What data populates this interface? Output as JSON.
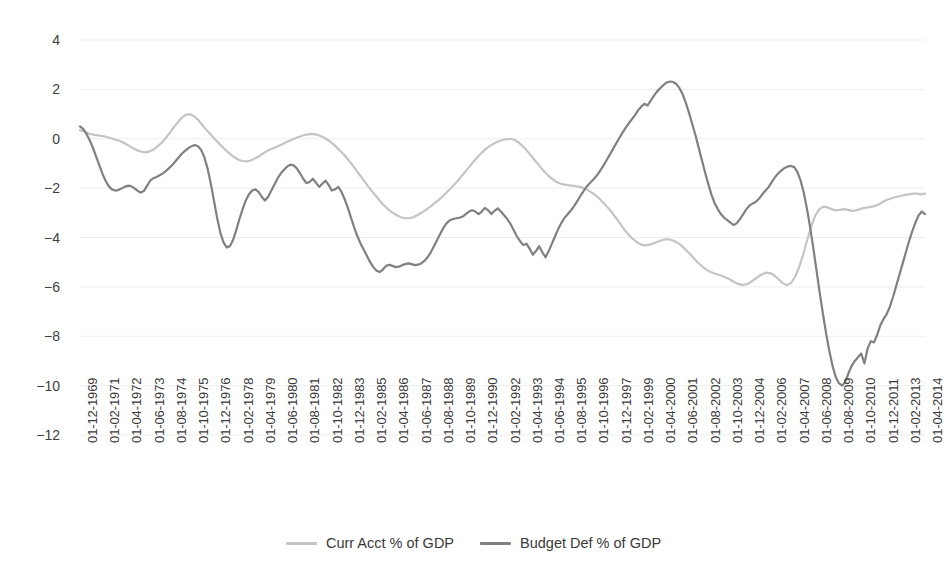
{
  "chart_data": {
    "type": "line",
    "title": "",
    "subtitle": "",
    "xlabel": "",
    "ylabel": "",
    "ylim": [
      -12,
      4
    ],
    "yticks": [
      4,
      2,
      0,
      -2,
      -4,
      -6,
      -8,
      -10,
      -12
    ],
    "ytick_labels": [
      "4",
      "2",
      "0",
      "−2",
      "−4",
      "−6",
      "−8",
      "−10",
      "−12"
    ],
    "grid": true,
    "grid_axis": "y",
    "legend_position": "bottom",
    "xtick_labels": [
      "01-12-1969",
      "01-02-1971",
      "01-04-1972",
      "01-06-1973",
      "01-08-1974",
      "01-10-1975",
      "01-12-1976",
      "01-02-1978",
      "01-04-1979",
      "01-06-1980",
      "01-08-1981",
      "01-10-1982",
      "01-12-1983",
      "01-02-1985",
      "01-04-1986",
      "01-06-1987",
      "01-08-1988",
      "01-10-1989",
      "01-12-1990",
      "01-02-1992",
      "01-04-1993",
      "01-06-1994",
      "01-08-1995",
      "01-10-1996",
      "01-12-1997",
      "01-02-1999",
      "01-04-2000",
      "01-06-2001",
      "01-08-2002",
      "01-10-2003",
      "01-12-2004",
      "01-02-2006",
      "01-04-2007",
      "01-06-2008",
      "01-08-2009",
      "01-10-2010",
      "01-12-2011",
      "01-02-2013",
      "01-04-2014"
    ],
    "x_start_year": 1969.917,
    "x_end_year": 2014.25,
    "series": [
      {
        "name": "Curr Acct % of GDP",
        "color": "#c4c4c4",
        "values": [
          0.35,
          0.3,
          0.22,
          0.18,
          0.15,
          0.12,
          0.1,
          0.05,
          0.0,
          -0.05,
          -0.1,
          -0.18,
          -0.28,
          -0.38,
          -0.46,
          -0.52,
          -0.55,
          -0.52,
          -0.45,
          -0.32,
          -0.18,
          0.0,
          0.22,
          0.45,
          0.65,
          0.85,
          0.97,
          1.0,
          0.92,
          0.78,
          0.58,
          0.38,
          0.2,
          0.02,
          -0.15,
          -0.32,
          -0.48,
          -0.62,
          -0.75,
          -0.85,
          -0.9,
          -0.92,
          -0.88,
          -0.8,
          -0.72,
          -0.6,
          -0.5,
          -0.42,
          -0.35,
          -0.28,
          -0.2,
          -0.12,
          -0.05,
          0.02,
          0.08,
          0.14,
          0.18,
          0.2,
          0.18,
          0.12,
          0.05,
          -0.05,
          -0.18,
          -0.32,
          -0.48,
          -0.65,
          -0.85,
          -1.05,
          -1.28,
          -1.5,
          -1.72,
          -1.95,
          -2.15,
          -2.35,
          -2.55,
          -2.72,
          -2.88,
          -3.0,
          -3.1,
          -3.18,
          -3.22,
          -3.22,
          -3.18,
          -3.1,
          -3.0,
          -2.9,
          -2.78,
          -2.65,
          -2.52,
          -2.38,
          -2.22,
          -2.05,
          -1.88,
          -1.7,
          -1.5,
          -1.3,
          -1.1,
          -0.9,
          -0.72,
          -0.55,
          -0.4,
          -0.28,
          -0.18,
          -0.1,
          -0.05,
          -0.02,
          0.0,
          -0.05,
          -0.15,
          -0.3,
          -0.48,
          -0.68,
          -0.88,
          -1.08,
          -1.28,
          -1.45,
          -1.6,
          -1.72,
          -1.8,
          -1.85,
          -1.88,
          -1.9,
          -1.92,
          -1.95,
          -2.0,
          -2.08,
          -2.18,
          -2.3,
          -2.45,
          -2.62,
          -2.8,
          -3.0,
          -3.22,
          -3.45,
          -3.68,
          -3.88,
          -4.05,
          -4.18,
          -4.28,
          -4.32,
          -4.3,
          -4.25,
          -4.18,
          -4.12,
          -4.08,
          -4.08,
          -4.12,
          -4.2,
          -4.32,
          -4.48,
          -4.65,
          -4.82,
          -5.0,
          -5.15,
          -5.28,
          -5.38,
          -5.45,
          -5.5,
          -5.55,
          -5.62,
          -5.7,
          -5.8,
          -5.88,
          -5.92,
          -5.9,
          -5.82,
          -5.7,
          -5.58,
          -5.48,
          -5.42,
          -5.45,
          -5.55,
          -5.7,
          -5.85,
          -5.92,
          -5.85,
          -5.6,
          -5.2,
          -4.7,
          -4.1,
          -3.55,
          -3.1,
          -2.85,
          -2.75,
          -2.78,
          -2.85,
          -2.9,
          -2.88,
          -2.85,
          -2.88,
          -2.92,
          -2.9,
          -2.85,
          -2.8,
          -2.78,
          -2.75,
          -2.7,
          -2.62,
          -2.52,
          -2.45,
          -2.4,
          -2.35,
          -2.32,
          -2.28,
          -2.25,
          -2.22,
          -2.22,
          -2.25,
          -2.22
        ]
      },
      {
        "name": "Budget Def % of GDP",
        "color": "#808080",
        "values": [
          0.5,
          0.4,
          0.2,
          -0.05,
          -0.35,
          -0.7,
          -1.05,
          -1.4,
          -1.7,
          -1.92,
          -2.05,
          -2.1,
          -2.08,
          -2.02,
          -1.95,
          -1.9,
          -1.92,
          -2.0,
          -2.1,
          -2.18,
          -2.12,
          -1.92,
          -1.7,
          -1.6,
          -1.55,
          -1.48,
          -1.4,
          -1.3,
          -1.18,
          -1.05,
          -0.9,
          -0.75,
          -0.6,
          -0.48,
          -0.38,
          -0.3,
          -0.25,
          -0.3,
          -0.45,
          -0.75,
          -1.2,
          -1.8,
          -2.5,
          -3.2,
          -3.8,
          -4.2,
          -4.4,
          -4.35,
          -4.1,
          -3.7,
          -3.25,
          -2.85,
          -2.5,
          -2.25,
          -2.1,
          -2.05,
          -2.15,
          -2.35,
          -2.5,
          -2.35,
          -2.1,
          -1.85,
          -1.6,
          -1.4,
          -1.25,
          -1.12,
          -1.05,
          -1.08,
          -1.2,
          -1.4,
          -1.62,
          -1.8,
          -1.75,
          -1.62,
          -1.78,
          -1.95,
          -1.82,
          -1.7,
          -1.88,
          -2.1,
          -2.05,
          -1.95,
          -2.15,
          -2.45,
          -2.8,
          -3.2,
          -3.6,
          -3.95,
          -4.25,
          -4.5,
          -4.75,
          -5.0,
          -5.2,
          -5.35,
          -5.4,
          -5.3,
          -5.15,
          -5.1,
          -5.15,
          -5.2,
          -5.18,
          -5.12,
          -5.08,
          -5.05,
          -5.08,
          -5.12,
          -5.1,
          -5.05,
          -4.95,
          -4.8,
          -4.6,
          -4.35,
          -4.1,
          -3.85,
          -3.6,
          -3.42,
          -3.3,
          -3.25,
          -3.22,
          -3.2,
          -3.15,
          -3.05,
          -2.95,
          -2.9,
          -2.95,
          -3.05,
          -2.95,
          -2.8,
          -2.9,
          -3.05,
          -2.92,
          -2.82,
          -2.95,
          -3.1,
          -3.25,
          -3.45,
          -3.7,
          -3.95,
          -4.15,
          -4.3,
          -4.25,
          -4.45,
          -4.7,
          -4.55,
          -4.35,
          -4.6,
          -4.8,
          -4.55,
          -4.25,
          -3.95,
          -3.65,
          -3.4,
          -3.2,
          -3.05,
          -2.9,
          -2.72,
          -2.52,
          -2.3,
          -2.1,
          -1.92,
          -1.78,
          -1.65,
          -1.5,
          -1.32,
          -1.12,
          -0.9,
          -0.68,
          -0.45,
          -0.22,
          0.0,
          0.22,
          0.42,
          0.6,
          0.78,
          0.95,
          1.15,
          1.3,
          1.42,
          1.35,
          1.55,
          1.75,
          1.92,
          2.05,
          2.18,
          2.28,
          2.32,
          2.3,
          2.22,
          2.05,
          1.8,
          1.45,
          1.05,
          0.6,
          0.15,
          -0.35,
          -0.85,
          -1.35,
          -1.82,
          -2.25,
          -2.6,
          -2.85,
          -3.05,
          -3.2,
          -3.3,
          -3.4,
          -3.5,
          -3.42,
          -3.25,
          -3.05,
          -2.85,
          -2.7,
          -2.62,
          -2.55,
          -2.42,
          -2.25,
          -2.1,
          -1.95,
          -1.75,
          -1.55,
          -1.4,
          -1.28,
          -1.18,
          -1.12,
          -1.1,
          -1.15,
          -1.35,
          -1.7,
          -2.2,
          -2.85,
          -3.6,
          -4.45,
          -5.35,
          -6.25,
          -7.1,
          -7.9,
          -8.6,
          -9.2,
          -9.65,
          -9.9,
          -10.0,
          -9.85,
          -9.5,
          -9.2,
          -9.0,
          -8.85,
          -8.7,
          -9.1,
          -8.5,
          -8.2,
          -8.25,
          -7.95,
          -7.55,
          -7.3,
          -7.1,
          -6.8,
          -6.4,
          -5.95,
          -5.5,
          -5.05,
          -4.6,
          -4.15,
          -3.75,
          -3.4,
          -3.1,
          -2.95,
          -3.05
        ]
      }
    ]
  },
  "legend": {
    "items": [
      {
        "label": "Curr Acct % of GDP",
        "color": "#c4c4c4"
      },
      {
        "label": "Budget Def % of GDP",
        "color": "#808080"
      }
    ]
  }
}
